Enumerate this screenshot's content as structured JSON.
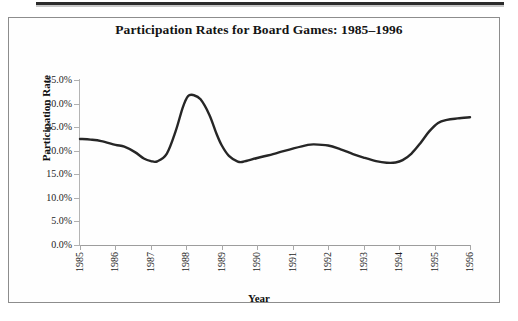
{
  "figure": {
    "title": "Participation Rates for Board Games: 1985–1996",
    "frame_color": "#8d8d8d",
    "background": "#ffffff",
    "scan_rule_color": "#2b2b2b"
  },
  "axes": {
    "x_title": "Year",
    "y_title": "Participation Rate",
    "y_ticks": [
      "0.0%",
      "5.0%",
      "10.0%",
      "15.0%",
      "20.0%",
      "25.0%",
      "30.0%",
      "35.0%"
    ],
    "x_ticks": [
      "1985",
      "1986",
      "1987",
      "1988",
      "1989",
      "1990",
      "1991",
      "1992",
      "1993",
      "1994",
      "1995",
      "1996"
    ]
  },
  "chart_data": {
    "type": "line",
    "title": "Participation Rates for Board Games: 1985–1996",
    "xlabel": "Year",
    "ylabel": "Participation Rate",
    "xlim": [
      1985,
      1996
    ],
    "ylim": [
      0,
      35
    ],
    "y_tick_values": [
      0,
      5,
      10,
      15,
      20,
      25,
      30,
      35
    ],
    "y_tick_labels": [
      "0.0%",
      "5.0%",
      "10.0%",
      "15.0%",
      "20.0%",
      "25.0%",
      "30.0%",
      "35.0%"
    ],
    "x_tick_values": [
      1985,
      1986,
      1987,
      1988,
      1989,
      1990,
      1991,
      1992,
      1993,
      1994,
      1995,
      1996
    ],
    "x_tick_labels": [
      "1985",
      "1986",
      "1987",
      "1988",
      "1989",
      "1990",
      "1991",
      "1992",
      "1993",
      "1994",
      "1995",
      "1996"
    ],
    "grid": false,
    "legend": "none",
    "units": "percent",
    "line_color": "#262626",
    "line_width_px": 2.4,
    "smoothing": "spline",
    "categories": [
      1985,
      1986,
      1987,
      1988,
      1989,
      1990,
      1991,
      1992,
      1993,
      1994,
      1995,
      1996
    ],
    "values": [
      22.5,
      21.2,
      17.8,
      31.8,
      19.0,
      19.6,
      21.3,
      20.2,
      18.0,
      18.5,
      26.4,
      27.1
    ],
    "series": [
      {
        "name": "Board Games",
        "values": [
          22.5,
          21.2,
          17.8,
          31.8,
          19.0,
          19.6,
          21.3,
          20.2,
          18.0,
          18.5,
          26.4,
          27.1
        ]
      }
    ],
    "dense_path": [
      {
        "year": 1985.0,
        "value": 22.5
      },
      {
        "year": 1985.3,
        "value": 22.35
      },
      {
        "year": 1985.6,
        "value": 22.05
      },
      {
        "year": 1986.0,
        "value": 21.25
      },
      {
        "year": 1986.25,
        "value": 20.85
      },
      {
        "year": 1986.55,
        "value": 19.7
      },
      {
        "year": 1986.8,
        "value": 18.35
      },
      {
        "year": 1987.0,
        "value": 17.8
      },
      {
        "year": 1987.18,
        "value": 17.75
      },
      {
        "year": 1987.45,
        "value": 19.4
      },
      {
        "year": 1987.7,
        "value": 24.2
      },
      {
        "year": 1987.9,
        "value": 29.2
      },
      {
        "year": 1988.05,
        "value": 31.6
      },
      {
        "year": 1988.2,
        "value": 31.8
      },
      {
        "year": 1988.4,
        "value": 30.9
      },
      {
        "year": 1988.65,
        "value": 27.6
      },
      {
        "year": 1988.85,
        "value": 23.6
      },
      {
        "year": 1989.0,
        "value": 21.1
      },
      {
        "year": 1989.2,
        "value": 18.9
      },
      {
        "year": 1989.45,
        "value": 17.7
      },
      {
        "year": 1989.6,
        "value": 17.65
      },
      {
        "year": 1990.0,
        "value": 18.45
      },
      {
        "year": 1990.5,
        "value": 19.4
      },
      {
        "year": 1991.0,
        "value": 20.45
      },
      {
        "year": 1991.4,
        "value": 21.2
      },
      {
        "year": 1991.6,
        "value": 21.35
      },
      {
        "year": 1992.0,
        "value": 21.1
      },
      {
        "year": 1992.35,
        "value": 20.3
      },
      {
        "year": 1992.7,
        "value": 19.3
      },
      {
        "year": 1993.0,
        "value": 18.55
      },
      {
        "year": 1993.35,
        "value": 17.8
      },
      {
        "year": 1993.65,
        "value": 17.45
      },
      {
        "year": 1993.9,
        "value": 17.5
      },
      {
        "year": 1994.1,
        "value": 18.0
      },
      {
        "year": 1994.35,
        "value": 19.4
      },
      {
        "year": 1994.6,
        "value": 21.6
      },
      {
        "year": 1994.85,
        "value": 24.1
      },
      {
        "year": 1995.1,
        "value": 25.9
      },
      {
        "year": 1995.35,
        "value": 26.55
      },
      {
        "year": 1995.65,
        "value": 26.85
      },
      {
        "year": 1996.0,
        "value": 27.1
      }
    ],
    "annotations": {
      "peak": {
        "year": 1988,
        "value": 31.8
      },
      "minimum": {
        "year": 1993.65,
        "value": 17.45
      }
    }
  }
}
